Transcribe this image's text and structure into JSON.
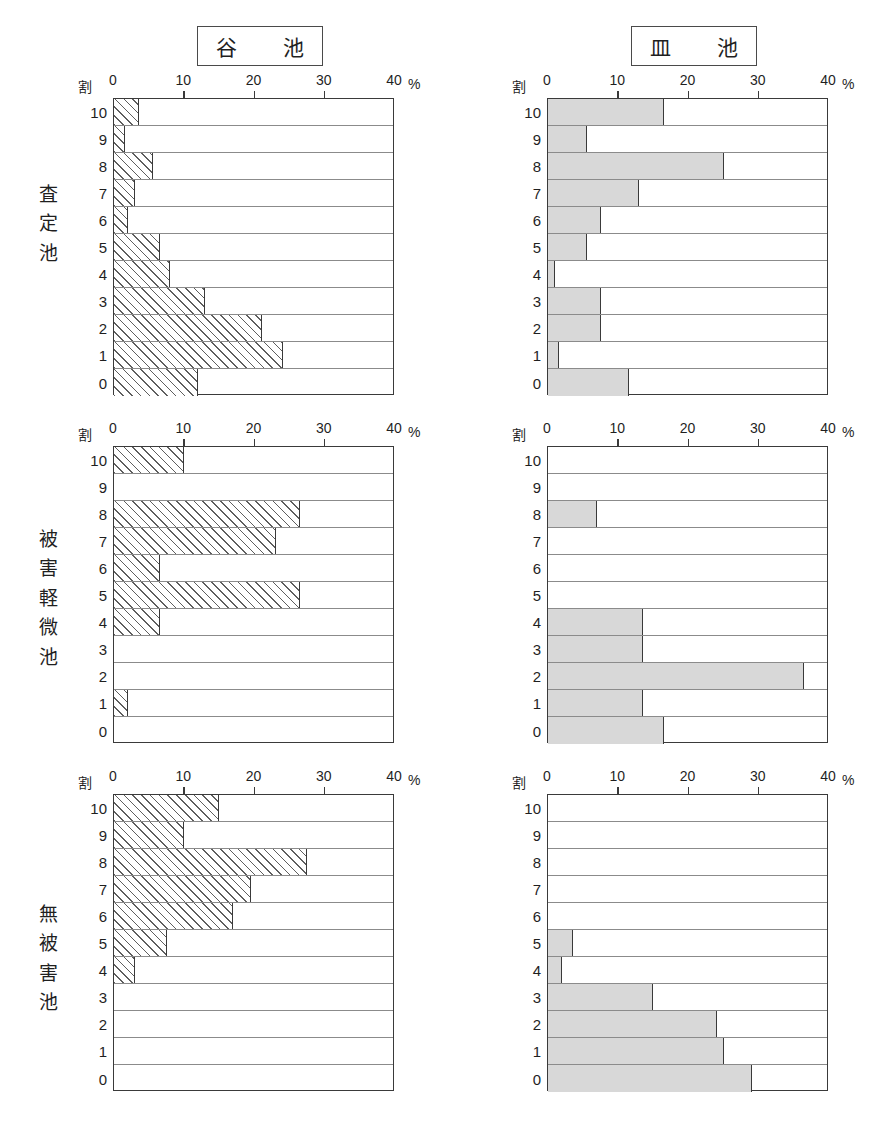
{
  "figure": {
    "axis_unit_label": "割",
    "percent_symbol": "%",
    "x_ticks": [
      "0",
      "10",
      "20",
      "30",
      "40"
    ],
    "x_min": 0,
    "x_max": 40,
    "y_categories": [
      "10",
      "9",
      "8",
      "7",
      "6",
      "5",
      "4",
      "3",
      "2",
      "1",
      "0"
    ],
    "column_titles": {
      "left": "谷　池",
      "right": "皿　池"
    },
    "row_labels": {
      "r1": [
        "査",
        "定",
        "池"
      ],
      "r2": [
        "被",
        "害",
        "軽",
        "微",
        "池"
      ],
      "r3": [
        "無",
        "被",
        "害",
        "池"
      ]
    },
    "colors": {
      "hatch_line": "#5e5e5e",
      "gray_fill": "#d8d8d8",
      "axis": "#3a3a3a",
      "gridline": "#8b8b8b",
      "text": "#1f1f1f"
    }
  },
  "chart_data": [
    {
      "type": "bar",
      "orientation": "horizontal",
      "title": "谷　池",
      "panel": "査定池",
      "xlabel": "%",
      "ylabel": "割",
      "xlim": [
        0,
        40
      ],
      "grid": true,
      "fill_style": "hatched",
      "categories": [
        "10",
        "9",
        "8",
        "7",
        "6",
        "5",
        "4",
        "3",
        "2",
        "1",
        "0"
      ],
      "values": [
        3.5,
        1.5,
        5.5,
        3.0,
        2.0,
        6.5,
        8.0,
        13.0,
        21.0,
        24.0,
        12.0
      ]
    },
    {
      "type": "bar",
      "orientation": "horizontal",
      "title": "皿　池",
      "panel": "査定池",
      "xlabel": "%",
      "ylabel": "割",
      "xlim": [
        0,
        40
      ],
      "grid": true,
      "fill_style": "solid-gray",
      "categories": [
        "10",
        "9",
        "8",
        "7",
        "6",
        "5",
        "4",
        "3",
        "2",
        "1",
        "0"
      ],
      "values": [
        16.5,
        5.5,
        25.0,
        13.0,
        7.5,
        5.5,
        1.0,
        7.5,
        7.5,
        1.5,
        11.5
      ]
    },
    {
      "type": "bar",
      "orientation": "horizontal",
      "title": "谷　池",
      "panel": "被害軽微池",
      "xlabel": "%",
      "ylabel": "割",
      "xlim": [
        0,
        40
      ],
      "grid": true,
      "fill_style": "hatched",
      "categories": [
        "10",
        "9",
        "8",
        "7",
        "6",
        "5",
        "4",
        "3",
        "2",
        "1",
        "0"
      ],
      "values": [
        10.0,
        0.0,
        26.5,
        23.0,
        6.5,
        26.5,
        6.5,
        0.0,
        0.0,
        2.0,
        0.0
      ]
    },
    {
      "type": "bar",
      "orientation": "horizontal",
      "title": "皿　池",
      "panel": "被害軽微池",
      "xlabel": "%",
      "ylabel": "割",
      "xlim": [
        0,
        40
      ],
      "grid": true,
      "fill_style": "solid-gray",
      "categories": [
        "10",
        "9",
        "8",
        "7",
        "6",
        "5",
        "4",
        "3",
        "2",
        "1",
        "0"
      ],
      "values": [
        0.0,
        0.0,
        7.0,
        0.0,
        0.0,
        0.0,
        13.5,
        13.5,
        36.5,
        13.5,
        16.5
      ]
    },
    {
      "type": "bar",
      "orientation": "horizontal",
      "title": "谷　池",
      "panel": "無被害池",
      "xlabel": "%",
      "ylabel": "割",
      "xlim": [
        0,
        40
      ],
      "grid": true,
      "fill_style": "hatched",
      "categories": [
        "10",
        "9",
        "8",
        "7",
        "6",
        "5",
        "4",
        "3",
        "2",
        "1",
        "0"
      ],
      "values": [
        15.0,
        10.0,
        27.5,
        19.5,
        17.0,
        7.5,
        3.0,
        0.0,
        0.0,
        0.0,
        0.0
      ]
    },
    {
      "type": "bar",
      "orientation": "horizontal",
      "title": "皿　池",
      "panel": "無被害池",
      "xlabel": "%",
      "ylabel": "割",
      "xlim": [
        0,
        40
      ],
      "grid": true,
      "fill_style": "solid-gray",
      "categories": [
        "10",
        "9",
        "8",
        "7",
        "6",
        "5",
        "4",
        "3",
        "2",
        "1",
        "0"
      ],
      "values": [
        0.0,
        0.0,
        0.0,
        0.0,
        0.0,
        3.5,
        2.0,
        15.0,
        24.0,
        25.0,
        29.0
      ]
    }
  ]
}
